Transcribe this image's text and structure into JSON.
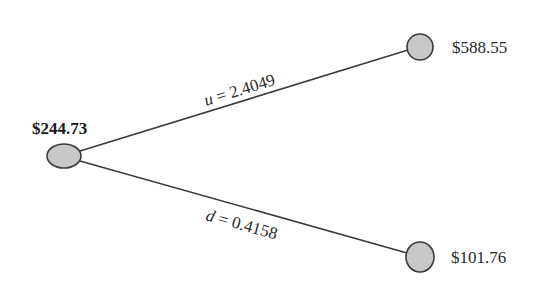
{
  "diagram": {
    "type": "binomial-tree",
    "steps": 1,
    "start_node": {
      "label": "$244.73",
      "value": 244.73
    },
    "up_node": {
      "label": "$588.55",
      "value": 588.55
    },
    "down_node": {
      "label": "$101.76",
      "value": 101.76
    },
    "up_branch": {
      "variable": "u",
      "equals": " = ",
      "value": "2.4049"
    },
    "down_branch": {
      "variable": "d",
      "equals": " = ",
      "value": "0.4158"
    }
  },
  "colors": {
    "node_fill": "#c8c8c8",
    "node_stroke": "#3a3a3a",
    "line": "#3a3a3a",
    "text": "#2a2a2a",
    "background": "#ffffff"
  }
}
